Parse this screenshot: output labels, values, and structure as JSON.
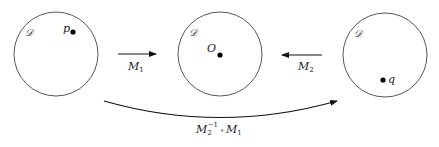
{
  "diagram": {
    "circles": [
      {
        "id": "left",
        "cx": 56,
        "cy": 54,
        "r": 42,
        "domain_label": "𝒟",
        "point": {
          "label": "p",
          "x": 73,
          "y": 32
        }
      },
      {
        "id": "center",
        "cx": 220,
        "cy": 54,
        "r": 42,
        "domain_label": "𝒟",
        "point": {
          "label": "O",
          "x": 220,
          "y": 54
        }
      },
      {
        "id": "right",
        "cx": 385,
        "cy": 55,
        "r": 42,
        "domain_label": "𝒟",
        "point": {
          "label": "q",
          "x": 384,
          "y": 80
        }
      }
    ],
    "arrows": [
      {
        "id": "m1",
        "from": "left",
        "to": "center",
        "label_main": "M",
        "label_sub": "1"
      },
      {
        "id": "m2",
        "from": "right",
        "to": "center",
        "label_main": "M",
        "label_sub": "2"
      },
      {
        "id": "composite",
        "from": "left",
        "to": "right",
        "label_main": "M",
        "label_sub": "2",
        "label_sup": "−1",
        "label_op": "∘",
        "label_main2": "M",
        "label_sub2": "1"
      }
    ],
    "colors": {
      "stroke": "#444444",
      "point": "#000000",
      "text": "#222222"
    }
  }
}
